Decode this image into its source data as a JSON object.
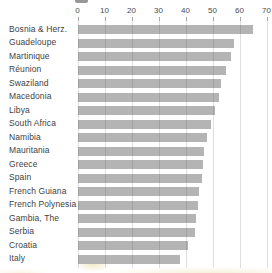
{
  "chart_data": {
    "type": "bar",
    "orientation": "horizontal",
    "title": "",
    "categories": [
      "Bosnia & Herz.",
      "Guadeloupe",
      "Martinique",
      "Réunion",
      "Swaziland",
      "Macedonia",
      "Libya",
      "South Africa",
      "Namibia",
      "Mauritania",
      "Greece",
      "Spain",
      "French Guiana",
      "French Polynesia",
      "Gambia, The",
      "Serbia",
      "Croatia",
      "Italy"
    ],
    "values": [
      65,
      58,
      57,
      55,
      53,
      52.5,
      51,
      49.5,
      48,
      47,
      46.5,
      46,
      45,
      44.5,
      44,
      43.5,
      41,
      38
    ],
    "x_ticks": [
      0,
      10,
      20,
      30,
      40,
      50,
      60,
      70
    ],
    "xlim": [
      0,
      72
    ],
    "grid": true,
    "legend": "none",
    "bar_color": "#b4b4b4",
    "gridline_color": "rgba(60,60,60,0.16)",
    "category_label_color": "#3f3f3f",
    "tick_label_color": "#4a4a4a"
  }
}
